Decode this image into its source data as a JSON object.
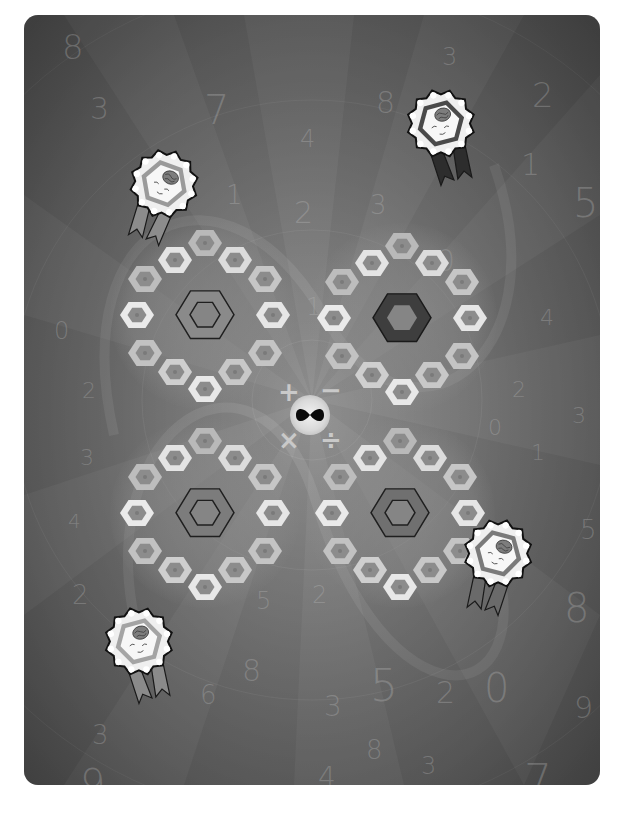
{
  "game": {
    "board": {
      "background_color": "#838383",
      "corner_radius": 14
    },
    "background_numerals": [
      {
        "text": "8",
        "x": 38,
        "y": 12,
        "size": 34
      },
      {
        "text": "3",
        "x": 66,
        "y": 76,
        "size": 30
      },
      {
        "text": "7",
        "x": 180,
        "y": 72,
        "size": 40
      },
      {
        "text": "4",
        "x": 276,
        "y": 110,
        "size": 24
      },
      {
        "text": "8",
        "x": 352,
        "y": 70,
        "size": 30
      },
      {
        "text": "3",
        "x": 418,
        "y": 28,
        "size": 24
      },
      {
        "text": "2",
        "x": 508,
        "y": 60,
        "size": 34
      },
      {
        "text": "1",
        "x": 202,
        "y": 165,
        "size": 26
      },
      {
        "text": "2",
        "x": 270,
        "y": 180,
        "size": 30
      },
      {
        "text": "3",
        "x": 346,
        "y": 175,
        "size": 26
      },
      {
        "text": "4",
        "x": 340,
        "y": 230,
        "size": 20
      },
      {
        "text": "0",
        "x": 412,
        "y": 228,
        "size": 30
      },
      {
        "text": "1",
        "x": 497,
        "y": 132,
        "size": 30
      },
      {
        "text": "5",
        "x": 549,
        "y": 165,
        "size": 40
      },
      {
        "text": "2",
        "x": 232,
        "y": 250,
        "size": 20
      },
      {
        "text": "1",
        "x": 282,
        "y": 278,
        "size": 24
      },
      {
        "text": "4",
        "x": 516,
        "y": 290,
        "size": 22
      },
      {
        "text": "0",
        "x": 30,
        "y": 302,
        "size": 24
      },
      {
        "text": "2",
        "x": 58,
        "y": 363,
        "size": 22
      },
      {
        "text": "3",
        "x": 56,
        "y": 430,
        "size": 22
      },
      {
        "text": "4",
        "x": 44,
        "y": 494,
        "size": 20
      },
      {
        "text": "2",
        "x": 488,
        "y": 362,
        "size": 22
      },
      {
        "text": "3",
        "x": 548,
        "y": 388,
        "size": 22
      },
      {
        "text": "0",
        "x": 464,
        "y": 400,
        "size": 22
      },
      {
        "text": "1",
        "x": 507,
        "y": 425,
        "size": 22
      },
      {
        "text": "5",
        "x": 556,
        "y": 500,
        "size": 26
      },
      {
        "text": "2",
        "x": 48,
        "y": 565,
        "size": 26
      },
      {
        "text": "5",
        "x": 232,
        "y": 572,
        "size": 24
      },
      {
        "text": "2",
        "x": 288,
        "y": 566,
        "size": 24
      },
      {
        "text": "8",
        "x": 218,
        "y": 638,
        "size": 30
      },
      {
        "text": "6",
        "x": 176,
        "y": 665,
        "size": 26
      },
      {
        "text": "3",
        "x": 300,
        "y": 675,
        "size": 28
      },
      {
        "text": "5",
        "x": 346,
        "y": 645,
        "size": 44
      },
      {
        "text": "2",
        "x": 412,
        "y": 660,
        "size": 30
      },
      {
        "text": "0",
        "x": 460,
        "y": 650,
        "size": 40
      },
      {
        "text": "8",
        "x": 540,
        "y": 570,
        "size": 40
      },
      {
        "text": "9",
        "x": 550,
        "y": 675,
        "size": 30
      },
      {
        "text": "3",
        "x": 68,
        "y": 705,
        "size": 26
      },
      {
        "text": "8",
        "x": 342,
        "y": 720,
        "size": 26
      },
      {
        "text": "4",
        "x": 294,
        "y": 746,
        "size": 28
      },
      {
        "text": "3",
        "x": 397,
        "y": 737,
        "size": 24
      },
      {
        "text": "9",
        "x": 56,
        "y": 746,
        "size": 40
      },
      {
        "text": "7",
        "x": 500,
        "y": 740,
        "size": 44
      }
    ],
    "hex_rings": [
      {
        "id": "ring-top-left",
        "cx": 181,
        "cy": 300,
        "center_style": "outlined",
        "center_fill": "#8a8a8a",
        "center_stroke": "#1f1f1f"
      },
      {
        "id": "ring-top-right",
        "cx": 378,
        "cy": 303,
        "center_style": "filled",
        "center_fill": "#3e3e3e",
        "center_stroke": "#1a1a1a"
      },
      {
        "id": "ring-bottom-left",
        "cx": 181,
        "cy": 498,
        "center_style": "outlined",
        "center_fill": "#7c7c7c",
        "center_stroke": "#1f1f1f"
      },
      {
        "id": "ring-bottom-right",
        "cx": 376,
        "cy": 498,
        "center_style": "outlined",
        "center_fill": "#707070",
        "center_stroke": "#1f1f1f"
      }
    ],
    "ring_tile_offsets": [
      {
        "dx": 0,
        "dy": -72,
        "shade": "#b9b9b9"
      },
      {
        "dx": -30,
        "dy": -55,
        "shade": "#e4e4e4"
      },
      {
        "dx": 30,
        "dy": -55,
        "shade": "#dcdcdc"
      },
      {
        "dx": -60,
        "dy": -36,
        "shade": "#bdbdbd"
      },
      {
        "dx": 60,
        "dy": -36,
        "shade": "#c6c6c6"
      },
      {
        "dx": -68,
        "dy": 0,
        "shade": "#eaeaea"
      },
      {
        "dx": 68,
        "dy": 0,
        "shade": "#e6e6e6"
      },
      {
        "dx": -60,
        "dy": 38,
        "shade": "#c2c2c2"
      },
      {
        "dx": 60,
        "dy": 38,
        "shade": "#c4c4c4"
      },
      {
        "dx": -30,
        "dy": 57,
        "shade": "#cfcfcf"
      },
      {
        "dx": 30,
        "dy": 57,
        "shade": "#c8c8c8"
      },
      {
        "dx": 0,
        "dy": 74,
        "shade": "#e8e8e8"
      }
    ],
    "operators": [
      {
        "name": "plus",
        "symbol": "+",
        "x": 254,
        "y": 362,
        "size": 26
      },
      {
        "name": "minus",
        "symbol": "−",
        "x": 296,
        "y": 360,
        "size": 26
      },
      {
        "name": "times",
        "symbol": "×",
        "x": 254,
        "y": 410,
        "size": 26
      },
      {
        "name": "divide",
        "symbol": "÷",
        "x": 296,
        "y": 410,
        "size": 26
      }
    ],
    "center_button": {
      "icon": "infinity-icon",
      "symbol": "∞"
    },
    "badges": [
      {
        "id": "player-badge-top-left",
        "x": 96,
        "y": 130,
        "rotation": 20,
        "frame": "#9a9a9a",
        "ribbon": "#8c8c8c",
        "icon": "brain-icon"
      },
      {
        "id": "player-badge-top-right",
        "x": 380,
        "y": 70,
        "rotation": -15,
        "frame": "#4a4a4a",
        "ribbon": "#2d2d2d",
        "icon": "brain-icon"
      },
      {
        "id": "player-badge-bottom-right",
        "x": 431,
        "y": 500,
        "rotation": 15,
        "frame": "#7a7a7a",
        "ribbon": "#6a6a6a",
        "icon": "brain-icon"
      },
      {
        "id": "player-badge-bottom-left",
        "x": 78,
        "y": 588,
        "rotation": -15,
        "frame": "#a4a4a4",
        "ribbon": "#8a8a8a",
        "icon": "brain-icon"
      }
    ]
  }
}
